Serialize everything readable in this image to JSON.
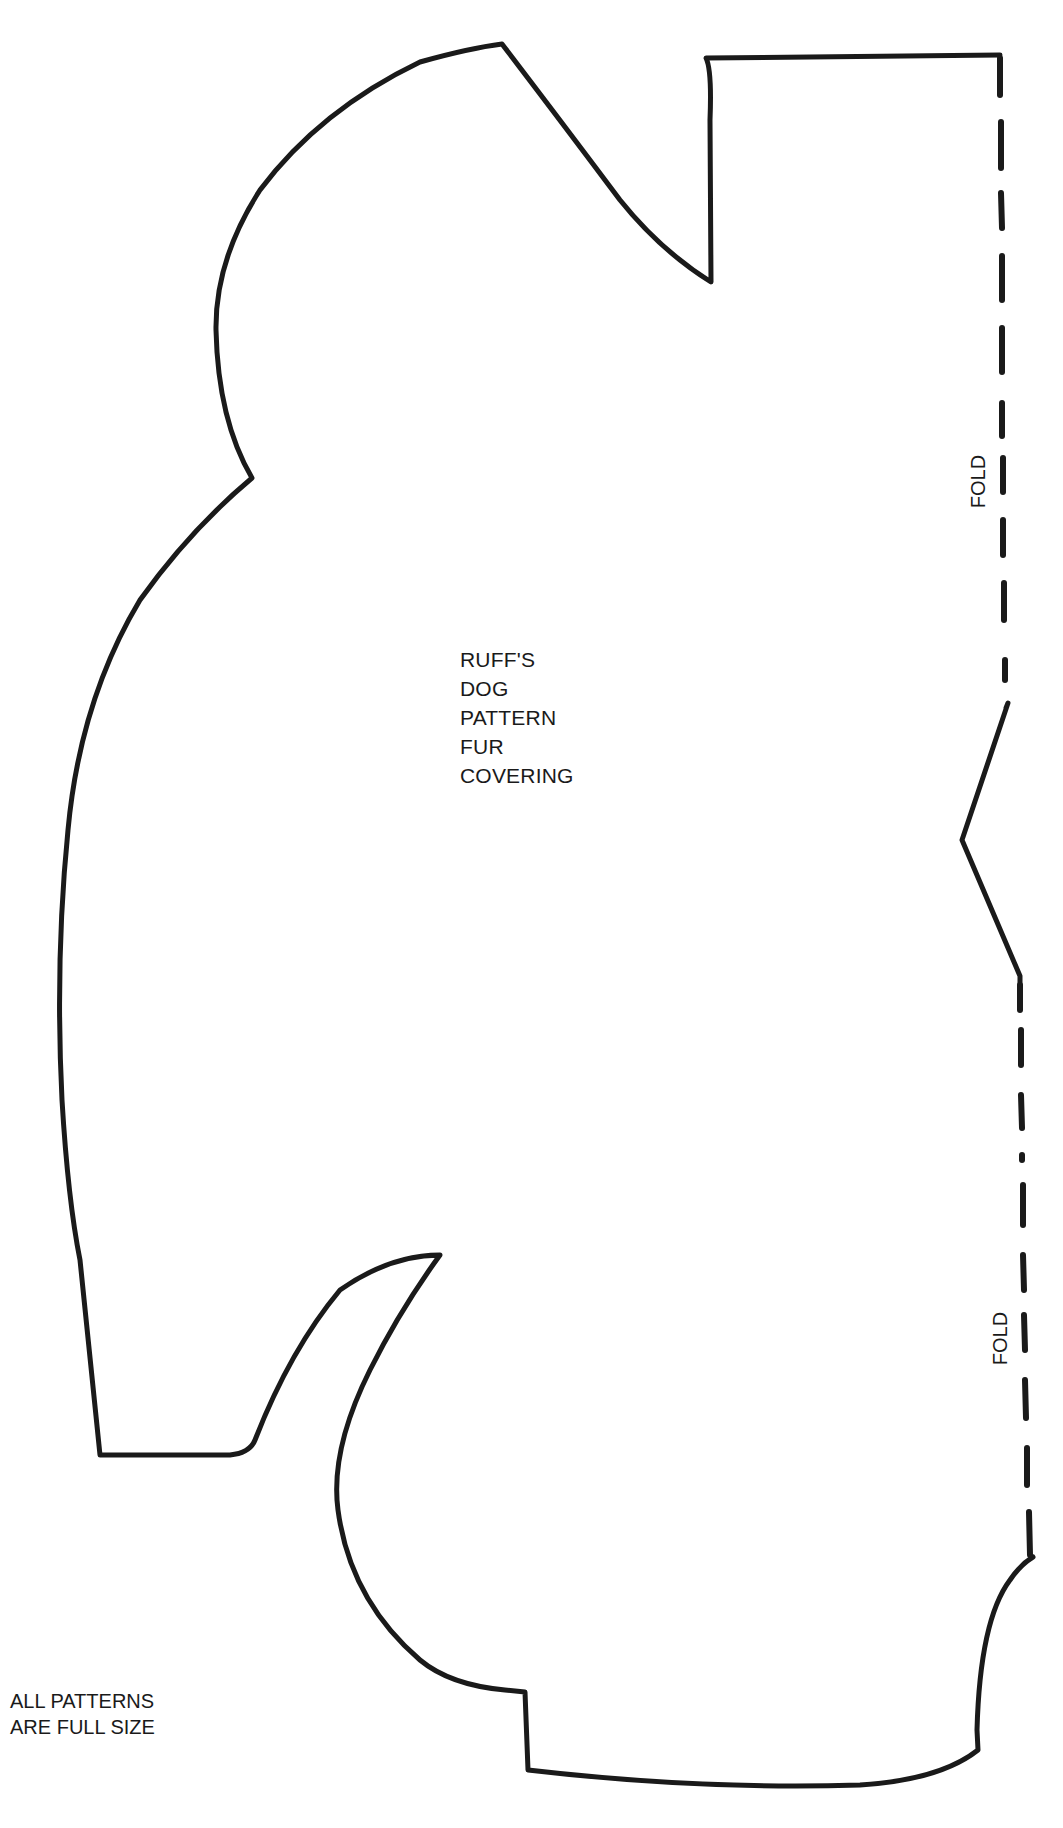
{
  "pattern": {
    "title_lines": [
      "RUFF'S",
      "DOG",
      "PATTERN",
      "FUR",
      "COVERING"
    ],
    "fold_labels": [
      "FOLD",
      "FOLD"
    ],
    "footer_lines": [
      "ALL PATTERNS",
      "ARE FULL SIZE"
    ],
    "line_color": "#1a1a1a",
    "background_color": "#ffffff"
  }
}
